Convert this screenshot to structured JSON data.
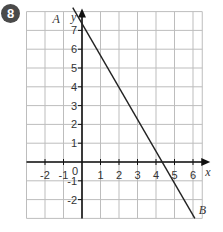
{
  "question_number": "8",
  "chart_data": {
    "type": "line",
    "title": "",
    "xlabel": "x",
    "ylabel": "y",
    "xlim": [
      -3,
      6.5
    ],
    "ylim": [
      -3,
      8
    ],
    "grid": true,
    "x_ticks": [
      "-2",
      "-1",
      "0",
      "1",
      "2",
      "3",
      "4",
      "5",
      "6"
    ],
    "y_ticks": [
      "7",
      "6",
      "5",
      "4",
      "3",
      "2",
      "1",
      "-1",
      "-2"
    ],
    "series": [
      {
        "name": "AB",
        "points": [
          {
            "x": -0.5,
            "y": 8
          },
          {
            "x": 6.1,
            "y": -3
          }
        ],
        "equation_hint": "y = 6 - 1.5x",
        "passes_through": [
          {
            "x": 0,
            "y": 6
          },
          {
            "x": 4,
            "y": 0
          }
        ]
      }
    ],
    "annotations": [
      {
        "text": "A",
        "near": {
          "x": -0.5,
          "y": 8
        }
      },
      {
        "text": "B",
        "near": {
          "x": 6.1,
          "y": -3
        }
      }
    ],
    "colors": {
      "grid": "#bbbbbb",
      "axis": "#111111",
      "line": "#222222"
    }
  }
}
